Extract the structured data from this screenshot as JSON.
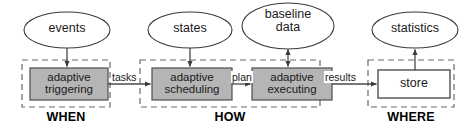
{
  "diagram": {
    "colors": {
      "process_fill": "#b5b5b5",
      "process_stroke": "#4d4d4d",
      "store_fill": "#ffffff",
      "store_stroke": "#333333",
      "ellipse_fill": "#ffffff",
      "ellipse_stroke": "#3a3a3a",
      "group_stroke": "#6b6b6b",
      "edge_stroke": "#4a4a4a",
      "text": "#1a1a1a",
      "background": "#ffffff"
    },
    "ellipses": [
      {
        "id": "events",
        "label": "events",
        "cx": 67,
        "cy": 30,
        "rx": 43,
        "ry": 18
      },
      {
        "id": "states",
        "label": "states",
        "cx": 190,
        "cy": 30,
        "rx": 42,
        "ry": 18
      },
      {
        "id": "baseline-data",
        "label": "baseline\ndata",
        "cx": 288,
        "cy": 26,
        "rx": 46,
        "ry": 23
      },
      {
        "id": "statistics",
        "label": "statistics",
        "cx": 415,
        "cy": 30,
        "rx": 43,
        "ry": 18
      }
    ],
    "groups": [
      {
        "id": "when",
        "label": "WHEN",
        "x": 22,
        "y": 60,
        "w": 88,
        "h": 47,
        "label_cx": 66
      },
      {
        "id": "how",
        "label": "HOW",
        "x": 140,
        "y": 60,
        "w": 180,
        "h": 47,
        "label_cx": 230
      },
      {
        "id": "where",
        "label": "WHERE",
        "x": 368,
        "y": 60,
        "w": 86,
        "h": 47,
        "label_cx": 411
      }
    ],
    "boxes": [
      {
        "id": "adaptive-triggering",
        "label": "adaptive\ntriggering",
        "x": 30,
        "y": 68,
        "w": 78,
        "h": 32,
        "style": "process"
      },
      {
        "id": "adaptive-scheduling",
        "label": "adaptive\nscheduling",
        "x": 152,
        "y": 68,
        "w": 80,
        "h": 32,
        "style": "process"
      },
      {
        "id": "adaptive-executing",
        "label": "adaptive\nexecuting",
        "x": 252,
        "y": 68,
        "w": 80,
        "h": 32,
        "style": "process"
      },
      {
        "id": "store",
        "label": "store",
        "x": 378,
        "y": 70,
        "w": 72,
        "h": 28,
        "style": "store"
      }
    ],
    "edges": [
      {
        "id": "events-to-triggering",
        "from": "events",
        "to": "adaptive-triggering",
        "label": "",
        "direction": "down"
      },
      {
        "id": "triggering-to-scheduling",
        "from": "adaptive-triggering",
        "to": "adaptive-scheduling",
        "label": "tasks",
        "direction": "right",
        "label_x": 112,
        "label_y": 73
      },
      {
        "id": "states-to-scheduling",
        "from": "states",
        "to": "adaptive-scheduling",
        "label": "",
        "direction": "down"
      },
      {
        "id": "scheduling-to-executing",
        "from": "adaptive-scheduling",
        "to": "adaptive-executing",
        "label": "plan",
        "direction": "right",
        "label_x": 232,
        "label_y": 73
      },
      {
        "id": "baseline-data-executing",
        "from": "baseline data",
        "to": "adaptive-executing",
        "label": "",
        "direction": "bidirectional"
      },
      {
        "id": "executing-to-store",
        "from": "adaptive-executing",
        "to": "store",
        "label": "results",
        "direction": "right",
        "label_x": 325,
        "label_y": 73
      },
      {
        "id": "store-to-statistics",
        "from": "store",
        "to": "statistics",
        "label": "",
        "direction": "up"
      }
    ]
  }
}
